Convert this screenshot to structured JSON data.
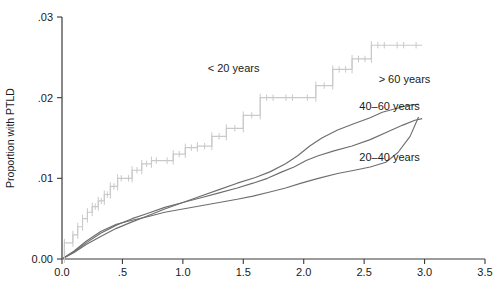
{
  "chart_data": {
    "type": "line",
    "title": "",
    "subtitle": "",
    "xlabel": "",
    "ylabel": "Proportion with PTLD",
    "xlim": [
      0.0,
      3.5
    ],
    "ylim": [
      0.0,
      0.03
    ],
    "grid": false,
    "legend_position": "inline-annotations",
    "x_ticks": [
      "0.0",
      ".5",
      "1.0",
      "1.5",
      "2.0",
      "2.5",
      "3.0",
      "3.5"
    ],
    "x_tick_values": [
      0.0,
      0.5,
      1.0,
      1.5,
      2.0,
      2.5,
      3.0,
      3.5
    ],
    "y_ticks": [
      "0.00",
      ".01",
      ".02",
      ".03"
    ],
    "y_tick_values": [
      0.0,
      0.01,
      0.02,
      0.03
    ],
    "series": [
      {
        "name": "< 20 years",
        "style": "step",
        "color": "#c9c9c9",
        "label_x": 1.42,
        "label_y": 0.0232,
        "censored_marks": true,
        "x": [
          0.0,
          0.02,
          0.05,
          0.09,
          0.13,
          0.17,
          0.21,
          0.25,
          0.3,
          0.35,
          0.4,
          0.46,
          0.52,
          0.58,
          0.66,
          0.74,
          0.82,
          0.92,
          1.02,
          1.12,
          1.24,
          1.36,
          1.5,
          1.64,
          1.8,
          1.96,
          2.1,
          2.24,
          2.4,
          2.56,
          2.72,
          2.88,
          2.98
        ],
        "y": [
          0.0,
          0.002,
          0.002,
          0.003,
          0.004,
          0.005,
          0.0058,
          0.0065,
          0.0072,
          0.008,
          0.009,
          0.01,
          0.01,
          0.011,
          0.0118,
          0.0122,
          0.0122,
          0.013,
          0.0138,
          0.014,
          0.0152,
          0.0162,
          0.0178,
          0.02,
          0.02,
          0.02,
          0.0215,
          0.0235,
          0.0248,
          0.0265,
          0.0265,
          0.0265,
          0.0265
        ]
      },
      {
        "name": "> 60 years",
        "style": "line",
        "color": "#6e6e6e",
        "label_x": 2.62,
        "label_y": 0.0218,
        "x": [
          0.0,
          0.1,
          0.2,
          0.32,
          0.45,
          0.58,
          0.7,
          0.85,
          1.0,
          1.15,
          1.3,
          1.45,
          1.6,
          1.72,
          1.85,
          1.95,
          2.05,
          2.15,
          2.28,
          2.42,
          2.55,
          2.65,
          2.75,
          2.85,
          2.95
        ],
        "y": [
          0.0,
          0.0008,
          0.0018,
          0.0028,
          0.0038,
          0.0046,
          0.0053,
          0.0062,
          0.007,
          0.0078,
          0.0086,
          0.0094,
          0.0101,
          0.0108,
          0.0118,
          0.0128,
          0.014,
          0.015,
          0.016,
          0.0168,
          0.0175,
          0.0182,
          0.0186,
          0.019,
          0.0192
        ]
      },
      {
        "name": "40–60 years",
        "style": "line",
        "color": "#6e6e6e",
        "label_x": 2.46,
        "label_y": 0.0185,
        "x": [
          0.0,
          0.1,
          0.2,
          0.32,
          0.45,
          0.58,
          0.7,
          0.85,
          1.0,
          1.15,
          1.3,
          1.45,
          1.58,
          1.7,
          1.82,
          1.92,
          2.02,
          2.12,
          2.25,
          2.4,
          2.55,
          2.7,
          2.82,
          2.92,
          2.98
        ],
        "y": [
          0.0,
          0.0009,
          0.002,
          0.0032,
          0.0042,
          0.005,
          0.0056,
          0.0064,
          0.007,
          0.0076,
          0.0082,
          0.0088,
          0.0094,
          0.01,
          0.0108,
          0.0114,
          0.0122,
          0.0128,
          0.0134,
          0.014,
          0.0148,
          0.0158,
          0.0166,
          0.0172,
          0.0174
        ]
      },
      {
        "name": "20–40 years",
        "style": "line",
        "color": "#6e6e6e",
        "label_x": 2.46,
        "label_y": 0.0122,
        "x": [
          0.0,
          0.1,
          0.2,
          0.32,
          0.45,
          0.58,
          0.7,
          0.85,
          1.0,
          1.15,
          1.3,
          1.45,
          1.58,
          1.72,
          1.85,
          1.98,
          2.12,
          2.28,
          2.42,
          2.55,
          2.68,
          2.78,
          2.88,
          2.95
        ],
        "y": [
          0.0,
          0.001,
          0.0022,
          0.0034,
          0.0043,
          0.0048,
          0.0052,
          0.0058,
          0.0062,
          0.0066,
          0.007,
          0.0074,
          0.0078,
          0.0083,
          0.0088,
          0.0094,
          0.01,
          0.0106,
          0.011,
          0.0114,
          0.012,
          0.0132,
          0.0152,
          0.0176
        ]
      }
    ],
    "annotations": [
      {
        "text": "< 20 years",
        "x": 1.42,
        "y": 0.0232
      },
      {
        "text": "> 60 years",
        "x": 2.62,
        "y": 0.0218
      },
      {
        "text": "40–60 years",
        "x": 2.46,
        "y": 0.0185
      },
      {
        "text": "20–40 years",
        "x": 2.46,
        "y": 0.0122
      }
    ]
  }
}
